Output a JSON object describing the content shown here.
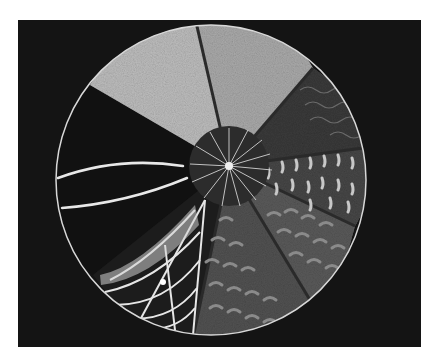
{
  "image": {
    "description": "Chalk/pastel drawing of a circle divided into eight radial wedges with a radiating hub, on a black background",
    "background_color": "#141414",
    "frame": {
      "x": 18,
      "y": 20,
      "width": 403,
      "height": 327
    },
    "circle": {
      "cx": 211,
      "cy": 180,
      "r": 155,
      "outline": "#d8d8d8"
    },
    "hub": {
      "cx": 229,
      "cy": 166,
      "r": 40
    }
  },
  "segments": [
    {
      "name": "top-left-light-textured",
      "fill": "#b9b9b9"
    },
    {
      "name": "top-light-textured",
      "fill": "#a8a8a8"
    },
    {
      "name": "dark-wavy",
      "fill": "#3a3a3a"
    },
    {
      "name": "cream-dashes",
      "fill": "#4a4a4a"
    },
    {
      "name": "scalloped-medium",
      "fill": "#5c5c5c"
    },
    {
      "name": "scalloped-lower",
      "fill": "#555555"
    },
    {
      "name": "web-pattern",
      "fill": "#1a1a1a"
    },
    {
      "name": "black-with-curves",
      "fill": "#121212"
    }
  ]
}
